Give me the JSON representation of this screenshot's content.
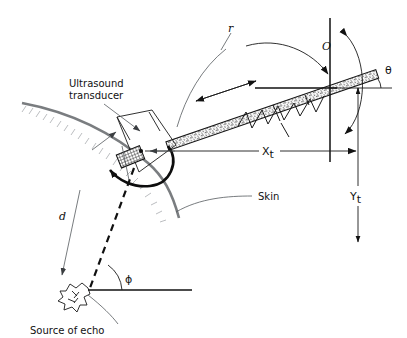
{
  "figure": {
    "background_color": "#ffffff",
    "ink_color": "#111111",
    "skin_color": "#7a7d80",
    "leader_color": "#555a5e"
  },
  "labels": {
    "ultrasound_line1": "Ultrasound",
    "ultrasound_line2": "transducer",
    "skin": "Skin",
    "source_of_echo": "Source of echo",
    "origin": "O",
    "theta": "θ",
    "phi": "ϕ",
    "distance_d": "d",
    "range_r": "r",
    "x_main": "X",
    "x_sub": "t",
    "y_main": "Y",
    "y_sub": "t"
  },
  "icons": {
    "echo_source": "starburst-blob-icon",
    "transducer_crystal": "crosshatch-crystal-icon",
    "beam": "stippled-beam-icon",
    "sawtooth": "sawtooth-wave-icon",
    "swing_arc": "rotation-arc-icon"
  },
  "geometry": {
    "origin_point": [
      330,
      88
    ],
    "transducer_center": [
      141,
      151
    ],
    "echo_source_point": [
      88,
      290
    ],
    "beam_angle_deg": -19,
    "x_axis_label_pos": [
      267,
      151
    ],
    "y_axis_label_pos": [
      363,
      197
    ]
  }
}
